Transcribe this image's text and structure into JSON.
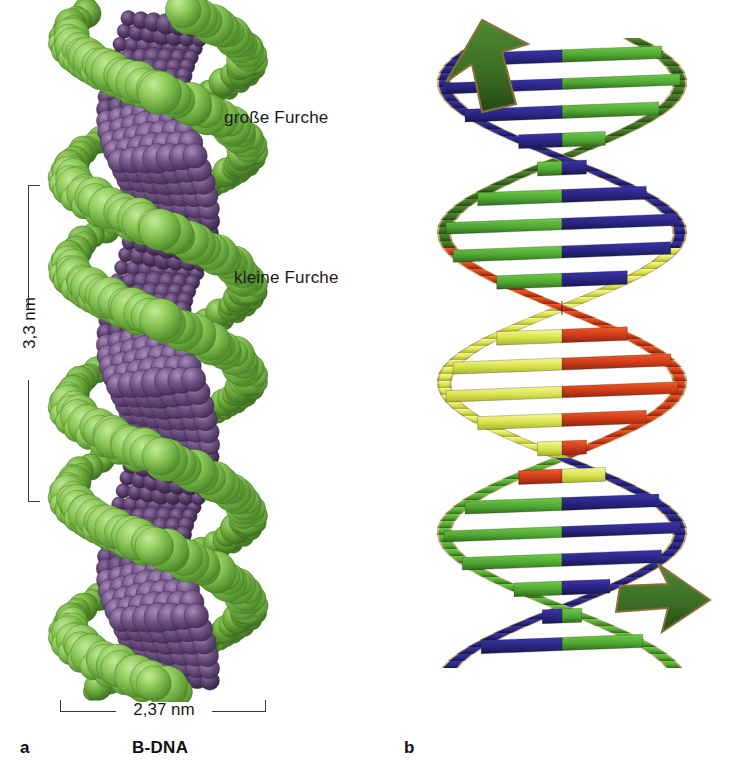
{
  "figure": {
    "type": "scientific-illustration",
    "panels": [
      {
        "letter": "a",
        "caption": "B-DNA",
        "model": "space-filling",
        "labels": [
          "große Furche",
          "kleine Furche"
        ],
        "dimensions": [
          {
            "axis": "height",
            "value": "3,3 nm"
          },
          {
            "axis": "width",
            "value": "2,37 nm"
          }
        ]
      },
      {
        "letter": "b",
        "caption": "",
        "model": "ribbon-helix",
        "labels": [],
        "dimensions": []
      }
    ]
  },
  "labels": {
    "major_groove": "große Furche",
    "minor_groove": "kleine Furche"
  },
  "dimensions": {
    "helix_pitch": "3,3 nm",
    "helix_diameter": "2,37 nm"
  },
  "panels": {
    "a_letter": "a",
    "b_letter": "b",
    "a_caption": "B-DNA"
  },
  "colors": {
    "backbone_green": "#7fbf4d",
    "backbone_green_dark": "#4e8c2e",
    "base_purple": "#6d5080",
    "base_purple_dark": "#4b3459",
    "ribbon_green": "#5cb83c",
    "ribbon_green_dark": "#3d6b28",
    "ribbon_blue": "#2e2a8c",
    "ribbon_red": "#d64020",
    "ribbon_red_dark": "#a82d14",
    "ribbon_yellow": "#d8e24a",
    "ribbon_yellow_pale": "#f2f58a",
    "ribbon_edge_gold": "#c9a86a",
    "text": "#1a1a1a",
    "rule": "#3a3a3a",
    "background": "#ffffff"
  }
}
